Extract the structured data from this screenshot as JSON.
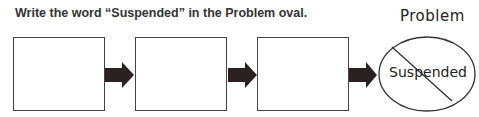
{
  "instruction": "Write the word “Suspended” in the Problem oval.",
  "boxes": [
    {
      "label": "",
      "position": 1
    },
    {
      "label": "",
      "position": 2
    },
    {
      "label": "",
      "position": 3
    }
  ],
  "problem": {
    "title": "Problem",
    "answer": "Suspended",
    "crossed_out": true
  },
  "colors": {
    "arrow": "#2a2222",
    "outline": "#444444"
  }
}
